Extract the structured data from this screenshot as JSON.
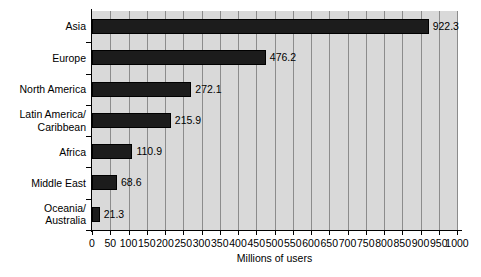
{
  "chart_data": {
    "type": "bar",
    "orientation": "horizontal",
    "title": "",
    "xlabel": "Millions of users",
    "ylabel": "",
    "categories": [
      "Asia",
      "Europe",
      "North America",
      "Latin America/ Caribbean",
      "Africa",
      "Middle East",
      "Oceania/ Australia"
    ],
    "category_lines": [
      [
        "Asia"
      ],
      [
        "Europe"
      ],
      [
        "North America"
      ],
      [
        "Latin America/",
        "Caribbean"
      ],
      [
        "Africa"
      ],
      [
        "Middle East"
      ],
      [
        "Oceania/",
        "Australia"
      ]
    ],
    "values": [
      922.3,
      476.2,
      272.1,
      215.9,
      110.9,
      68.6,
      21.3
    ],
    "value_labels": [
      "922.3",
      "476.2",
      "272.1",
      "215.9",
      "110.9",
      "68.6",
      "21.3"
    ],
    "xlim": [
      0,
      1000
    ],
    "xticks": [
      0,
      50,
      100,
      150,
      200,
      250,
      300,
      350,
      400,
      450,
      500,
      550,
      600,
      650,
      700,
      750,
      800,
      850,
      900,
      950,
      1000
    ],
    "xtick_labels": [
      "0",
      "50",
      "100",
      "150",
      "200",
      "250",
      "300",
      "350",
      "400",
      "450",
      "500",
      "550",
      "600",
      "650",
      "700",
      "750",
      "800",
      "850",
      "900",
      "950",
      "1000"
    ],
    "grid": true,
    "grid_axis": "x",
    "legend": false,
    "colors": {
      "bar": "#1c1c1c",
      "plot_background": "#d9d9d9",
      "gridline": "#8c8c8c",
      "axis": "#000000",
      "text": "#000000",
      "page_background": "#ffffff"
    }
  }
}
